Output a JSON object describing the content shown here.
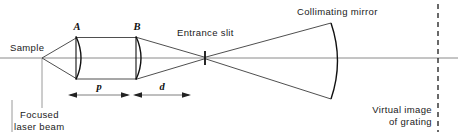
{
  "figure": {
    "background_color": "#ffffff",
    "ink_color": "#1a1a1a",
    "axis_color": "#8a8a8a"
  },
  "labels": {
    "sample": "Sample",
    "lens_a": "A",
    "lens_b": "B",
    "entrance_slit": "Entrance slit",
    "collimating_mirror": "Collimating mirror",
    "focused_laser_beam_line1": "Focused",
    "focused_laser_beam_line2": "laser beam",
    "virtual_image_line1": "Virtual image",
    "virtual_image_line2": "of grating",
    "dim_p": "p",
    "dim_d": "d"
  },
  "components": [
    {
      "name": "sample-point",
      "kind": "source-point",
      "x": 42,
      "y": 58
    },
    {
      "name": "lens-a",
      "kind": "plano-convex-lens",
      "x": 77,
      "top": 36,
      "bottom": 80
    },
    {
      "name": "lens-b",
      "kind": "plano-convex-lens",
      "x": 137,
      "top": 36,
      "bottom": 80
    },
    {
      "name": "entrance-slit",
      "kind": "slit",
      "x": 205,
      "top": 51,
      "bottom": 65
    },
    {
      "name": "collimating-mirror",
      "kind": "concave-mirror",
      "x": 330,
      "top": 22,
      "bottom": 100
    },
    {
      "name": "virtual-image-of-grating",
      "kind": "dashed-plane",
      "x": 438,
      "top": 4,
      "bottom": 132
    }
  ],
  "dimensions": [
    {
      "name": "p",
      "symbol": "p",
      "from_component": "lens-a",
      "to_component": "lens-b",
      "x_start": 68,
      "x_end": 130,
      "y": 95
    },
    {
      "name": "d",
      "symbol": "d",
      "from_component": "lens-b",
      "to_component": "entrance-slit",
      "x_start": 133,
      "x_end": 191,
      "y": 95
    }
  ]
}
